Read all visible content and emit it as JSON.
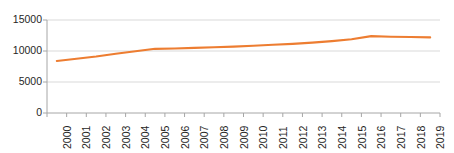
{
  "chart_data": {
    "type": "line",
    "title": "",
    "subtitle": "",
    "xlabel": "",
    "ylabel": "",
    "categories": [
      "2000",
      "2001",
      "2002",
      "2003",
      "2004",
      "2005",
      "2006",
      "2007",
      "2008",
      "2009",
      "2010",
      "2011",
      "2012",
      "2013",
      "2014",
      "2015",
      "2016",
      "2017",
      "2018",
      "2019"
    ],
    "series": [
      {
        "name": "series-1",
        "color": "#ED7D31",
        "values": [
          8400,
          8750,
          9100,
          9550,
          9950,
          10350,
          10400,
          10500,
          10600,
          10700,
          10850,
          11000,
          11150,
          11350,
          11600,
          11900,
          12400,
          12300,
          12250,
          12200
        ]
      }
    ],
    "ytick_labels": [
      "0",
      "5000",
      "10000",
      "15000"
    ],
    "ytick_values": [
      0,
      5000,
      10000,
      15000
    ],
    "ylim": [
      0,
      15000
    ],
    "grid": "horizontal",
    "legend": "none",
    "axis_color": "#A6A6A6",
    "text_color": "#262626"
  }
}
